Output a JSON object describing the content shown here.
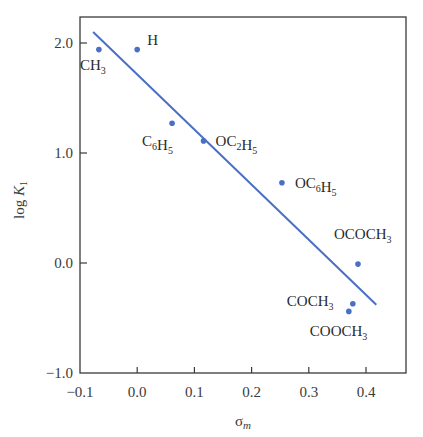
{
  "chart_data": {
    "type": "scatter",
    "title": "",
    "xlabel": "σ_m",
    "ylabel": "log K_1",
    "xlim": [
      -0.1,
      0.47
    ],
    "ylim": [
      -1.0,
      2.24
    ],
    "grid": false,
    "legend": null,
    "x_ticks": [
      -0.1,
      0.0,
      0.1,
      0.2,
      0.3,
      0.4
    ],
    "x_tick_labels": [
      "−0.1",
      "0.0",
      "0.1",
      "0.2",
      "0.3",
      "0.4"
    ],
    "y_ticks": [
      -1.0,
      0.0,
      1.0,
      2.0
    ],
    "y_tick_labels": [
      "−1.0",
      "0.0",
      "1.0",
      "2.0"
    ],
    "points": [
      {
        "label": "CH3",
        "main": "CH",
        "sub": "3",
        "x": -0.067,
        "y": 1.94
      },
      {
        "label": "H",
        "main": "H",
        "sub": "",
        "x": 0.0,
        "y": 1.94
      },
      {
        "label": "C6H5",
        "x": 0.061,
        "y": 1.27
      },
      {
        "label": "OC2H5",
        "x": 0.116,
        "y": 1.11
      },
      {
        "label": "OC6H5",
        "x": 0.253,
        "y": 0.73
      },
      {
        "label": "OCOCH3",
        "x": 0.386,
        "y": -0.01
      },
      {
        "label": "COCH3",
        "x": 0.377,
        "y": -0.37
      },
      {
        "label": "COOCH3",
        "x": 0.37,
        "y": -0.44
      }
    ],
    "fit_line": {
      "x": [
        -0.077,
        0.418
      ],
      "y": [
        2.1,
        -0.38
      ]
    },
    "colors": {
      "points": "#4a6fc4",
      "line": "#4a6fc4",
      "axes": "#3a3a3a"
    }
  }
}
